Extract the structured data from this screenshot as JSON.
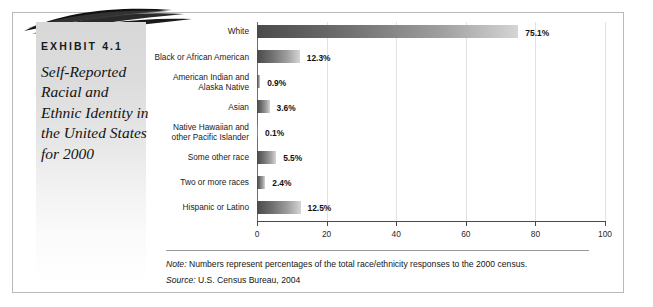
{
  "exhibit": {
    "label": "EXHIBIT 4.1",
    "title": "Self-Reported Racial and Ethnic Identity in the United States for 2000"
  },
  "footnotes": {
    "note_prefix": "Note:",
    "note_text": " Numbers represent percentages of the total race/ethnicity responses to the 2000 census.",
    "source_prefix": "Source:",
    "source_text": " U.S. Census Bureau, 2004"
  },
  "chart_data": {
    "type": "bar",
    "orientation": "horizontal",
    "title": "Self-Reported Racial and Ethnic Identity in the United States for 2000",
    "xlabel": "",
    "ylabel": "",
    "xlim": [
      0,
      100
    ],
    "xticks": [
      0,
      20,
      40,
      60,
      80,
      100
    ],
    "xtick_labels": [
      "0",
      "20",
      "40",
      "60",
      "80",
      "100"
    ],
    "grid": true,
    "legend": "none",
    "categories": [
      "White",
      "Black or African American",
      "American Indian and Alaska Native",
      "Asian",
      "Native Hawaiian and other Pacific Islander",
      "Some other race",
      "Two or more races",
      "Hispanic or Latino"
    ],
    "category_lines": [
      [
        "White"
      ],
      [
        "Black or African American"
      ],
      [
        "American Indian and",
        "Alaska Native"
      ],
      [
        "Asian"
      ],
      [
        "Native Hawaiian and",
        "other Pacific Islander"
      ],
      [
        "Some other race"
      ],
      [
        "Two or more races"
      ],
      [
        "Hispanic or Latino"
      ]
    ],
    "values": [
      75.1,
      12.3,
      0.9,
      3.6,
      0.1,
      5.5,
      2.4,
      12.5
    ],
    "value_labels": [
      "75.1%",
      "12.3%",
      "0.9%",
      "3.6%",
      "0.1%",
      "5.5%",
      "2.4%",
      "12.5%"
    ],
    "bar_fill": "gradient-dark-to-light",
    "bar_color_dark": "#4a4a4a",
    "bar_color_light": "#d5d5d5"
  }
}
